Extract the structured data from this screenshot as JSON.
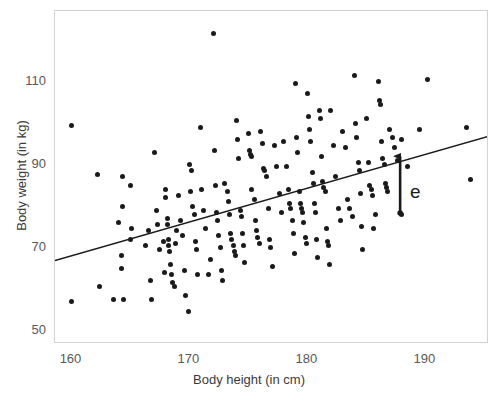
{
  "chart_data": {
    "type": "scatter",
    "title": "",
    "xlabel": "Body height (in cm)",
    "ylabel": "Body weight (in kg)",
    "xlim": [
      158.6,
      195.4
    ],
    "ylim": [
      46.75,
      127.0
    ],
    "xticks": [
      160,
      170,
      180,
      190
    ],
    "yticks": [
      50,
      70,
      90,
      110
    ],
    "xtick_labels": [
      "160",
      "170",
      "180",
      "190"
    ],
    "ytick_labels": [
      "50",
      "70",
      "90",
      "110"
    ],
    "grid": false,
    "legend": null,
    "point_color": "#1a1a1a",
    "line_color": "#1a1a1a",
    "frame_color": "#d3d3d3",
    "background": "#ffffff",
    "series": [
      {
        "name": "observations",
        "marker": "filled-circle",
        "points": [
          [
            160.0,
            99.5
          ],
          [
            160.0,
            57.0
          ],
          [
            162.2,
            87.5
          ],
          [
            162.4,
            60.5
          ],
          [
            163.6,
            57.5
          ],
          [
            164.0,
            76.0
          ],
          [
            164.2,
            68.0
          ],
          [
            164.2,
            65.0
          ],
          [
            164.3,
            87.0
          ],
          [
            164.3,
            80.0
          ],
          [
            164.4,
            57.5
          ],
          [
            165.0,
            85.0
          ],
          [
            165.0,
            72.0
          ],
          [
            165.1,
            74.5
          ],
          [
            166.3,
            70.5
          ],
          [
            166.5,
            74.0
          ],
          [
            166.7,
            62.0
          ],
          [
            166.8,
            57.5
          ],
          [
            167.0,
            93.0
          ],
          [
            167.2,
            79.0
          ],
          [
            167.3,
            75.5
          ],
          [
            167.5,
            69.5
          ],
          [
            167.8,
            71.5
          ],
          [
            167.9,
            64.0
          ],
          [
            168.0,
            84.0
          ],
          [
            168.0,
            82.0
          ],
          [
            168.1,
            77.0
          ],
          [
            168.1,
            75.5
          ],
          [
            168.2,
            72.0
          ],
          [
            168.2,
            70.5
          ],
          [
            168.3,
            69.0
          ],
          [
            168.4,
            66.0
          ],
          [
            168.5,
            63.5
          ],
          [
            168.6,
            61.5
          ],
          [
            168.7,
            60.5
          ],
          [
            168.8,
            71.0
          ],
          [
            168.9,
            74.0
          ],
          [
            169.1,
            82.5
          ],
          [
            169.2,
            76.5
          ],
          [
            169.4,
            73.0
          ],
          [
            169.6,
            64.5
          ],
          [
            169.7,
            58.5
          ],
          [
            169.9,
            54.5
          ],
          [
            170.0,
            90.0
          ],
          [
            170.1,
            83.5
          ],
          [
            170.2,
            88.5
          ],
          [
            170.3,
            80.0
          ],
          [
            170.4,
            78.0
          ],
          [
            170.5,
            71.5
          ],
          [
            170.6,
            69.5
          ],
          [
            170.7,
            63.5
          ],
          [
            170.9,
            99.0
          ],
          [
            171.0,
            84.0
          ],
          [
            171.2,
            79.0
          ],
          [
            171.4,
            74.5
          ],
          [
            171.6,
            63.5
          ],
          [
            171.8,
            67.0
          ],
          [
            172.0,
            121.5
          ],
          [
            172.1,
            93.5
          ],
          [
            172.2,
            85.0
          ],
          [
            172.3,
            78.5
          ],
          [
            172.4,
            76.5
          ],
          [
            172.5,
            73.0
          ],
          [
            172.6,
            70.0
          ],
          [
            172.7,
            64.5
          ],
          [
            172.8,
            62.0
          ],
          [
            173.0,
            85.5
          ],
          [
            173.2,
            83.5
          ],
          [
            173.3,
            81.0
          ],
          [
            173.4,
            78.0
          ],
          [
            173.5,
            73.5
          ],
          [
            173.6,
            72.0
          ],
          [
            173.7,
            70.5
          ],
          [
            173.8,
            69.0
          ],
          [
            173.9,
            68.0
          ],
          [
            174.0,
            100.5
          ],
          [
            174.1,
            96.0
          ],
          [
            174.2,
            91.5
          ],
          [
            174.3,
            79.0
          ],
          [
            174.4,
            77.5
          ],
          [
            174.5,
            73.5
          ],
          [
            174.6,
            70.5
          ],
          [
            174.7,
            66.5
          ],
          [
            175.0,
            97.5
          ],
          [
            175.1,
            93.5
          ],
          [
            175.2,
            92.5
          ],
          [
            175.3,
            92.0
          ],
          [
            175.3,
            84.0
          ],
          [
            175.5,
            81.5
          ],
          [
            175.6,
            76.5
          ],
          [
            175.7,
            74.0
          ],
          [
            175.8,
            72.5
          ],
          [
            175.9,
            71.0
          ],
          [
            176.0,
            98.0
          ],
          [
            176.2,
            95.0
          ],
          [
            176.3,
            89.0
          ],
          [
            176.4,
            88.5
          ],
          [
            176.5,
            87.0
          ],
          [
            176.7,
            79.5
          ],
          [
            176.8,
            72.0
          ],
          [
            176.9,
            70.0
          ],
          [
            177.0,
            65.5
          ],
          [
            177.2,
            94.5
          ],
          [
            177.4,
            89.5
          ],
          [
            177.6,
            83.0
          ],
          [
            177.8,
            78.5
          ],
          [
            178.0,
            95.5
          ],
          [
            178.2,
            89.5
          ],
          [
            178.4,
            84.0
          ],
          [
            178.5,
            80.5
          ],
          [
            178.6,
            79.5
          ],
          [
            178.7,
            76.5
          ],
          [
            178.8,
            73.5
          ],
          [
            178.9,
            68.5
          ],
          [
            179.0,
            109.5
          ],
          [
            179.1,
            96.5
          ],
          [
            179.2,
            93.0
          ],
          [
            179.3,
            83.5
          ],
          [
            179.4,
            80.5
          ],
          [
            179.5,
            79.5
          ],
          [
            179.6,
            78.5
          ],
          [
            179.7,
            76.0
          ],
          [
            179.8,
            72.5
          ],
          [
            179.9,
            71.0
          ],
          [
            180.0,
            107.0
          ],
          [
            180.1,
            101.5
          ],
          [
            180.2,
            98.5
          ],
          [
            180.3,
            95.5
          ],
          [
            180.4,
            88.0
          ],
          [
            180.5,
            85.5
          ],
          [
            180.6,
            80.5
          ],
          [
            180.7,
            78.5
          ],
          [
            180.8,
            72.0
          ],
          [
            180.9,
            67.5
          ],
          [
            181.0,
            103.0
          ],
          [
            181.1,
            101.0
          ],
          [
            181.2,
            92.0
          ],
          [
            181.3,
            86.0
          ],
          [
            181.4,
            84.5
          ],
          [
            181.5,
            83.5
          ],
          [
            181.6,
            74.5
          ],
          [
            181.7,
            71.5
          ],
          [
            181.8,
            70.5
          ],
          [
            181.9,
            66.0
          ],
          [
            182.0,
            103.0
          ],
          [
            182.2,
            94.5
          ],
          [
            182.4,
            87.0
          ],
          [
            182.6,
            79.5
          ],
          [
            182.8,
            76.5
          ],
          [
            183.0,
            98.0
          ],
          [
            183.2,
            94.0
          ],
          [
            183.4,
            81.5
          ],
          [
            183.6,
            79.5
          ],
          [
            183.8,
            77.5
          ],
          [
            184.0,
            111.5
          ],
          [
            184.1,
            100.0
          ],
          [
            184.2,
            96.5
          ],
          [
            184.3,
            90.5
          ],
          [
            184.4,
            88.5
          ],
          [
            184.5,
            83.0
          ],
          [
            184.6,
            75.0
          ],
          [
            184.7,
            69.5
          ],
          [
            185.0,
            101.0
          ],
          [
            185.2,
            90.5
          ],
          [
            185.3,
            85.0
          ],
          [
            185.4,
            84.0
          ],
          [
            185.5,
            82.5
          ],
          [
            185.6,
            74.5
          ],
          [
            185.8,
            78.0
          ],
          [
            186.0,
            110.0
          ],
          [
            186.1,
            105.5
          ],
          [
            186.2,
            104.5
          ],
          [
            186.3,
            95.5
          ],
          [
            186.4,
            91.5
          ],
          [
            186.5,
            90.0
          ],
          [
            186.6,
            85.5
          ],
          [
            186.7,
            84.5
          ],
          [
            186.8,
            83.5
          ],
          [
            187.0,
            98.5
          ],
          [
            187.2,
            96.5
          ],
          [
            187.4,
            94.0
          ],
          [
            187.6,
            91.0
          ],
          [
            188.0,
            96.0
          ],
          [
            188.0,
            78.0
          ],
          [
            188.5,
            89.5
          ],
          [
            189.5,
            98.5
          ],
          [
            190.2,
            110.5
          ],
          [
            193.5,
            99.0
          ],
          [
            193.8,
            86.5
          ]
        ]
      }
    ],
    "regression_line": {
      "name": "least-squares fit",
      "x_start": 158.6,
      "y_start": 66.5,
      "x_end": 196.0,
      "y_end": 97.0
    },
    "annotations": [
      {
        "name": "residual-arrow",
        "label": "e",
        "type": "arrow",
        "x": 188.0,
        "y_from": 78.0,
        "y_to": 92.0,
        "direction": "up",
        "label_x": 188.7,
        "label_y": 83.5
      }
    ]
  }
}
